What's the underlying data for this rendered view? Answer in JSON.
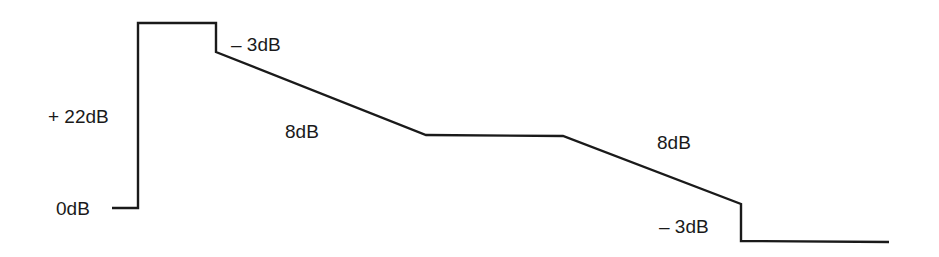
{
  "diagram": {
    "type": "level diagram",
    "stroke_color": "#1a1a1a",
    "background": "#ffffff",
    "path_points": [
      [
        112,
        208
      ],
      [
        138,
        208
      ],
      [
        138,
        23
      ],
      [
        216,
        23
      ],
      [
        216,
        52
      ],
      [
        426,
        135
      ],
      [
        563,
        136
      ],
      [
        741,
        204
      ],
      [
        741,
        241
      ],
      [
        889,
        242
      ]
    ],
    "labels": {
      "zero": "0dB",
      "gain": "+ 22dB",
      "drop_first": "– 3dB",
      "slope_first": "8dB",
      "slope_second": "8dB",
      "drop_second": "– 3dB"
    }
  }
}
